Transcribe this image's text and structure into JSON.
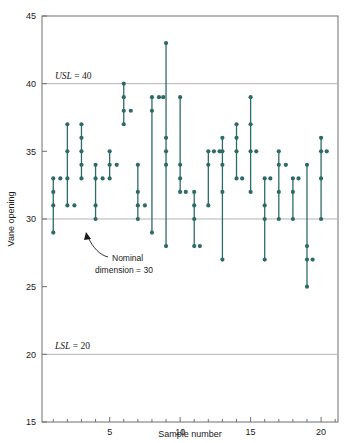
{
  "chart_data": {
    "type": "scatter",
    "title": "",
    "xlabel": "Sample number",
    "ylabel": "Vane opening",
    "xlim": [
      0.2,
      21.2
    ],
    "ylim": [
      15,
      45
    ],
    "xticks": [
      5,
      10,
      15,
      20
    ],
    "xtick_labels": [
      "5",
      "10",
      "15",
      "20"
    ],
    "xminor_step": 1,
    "yticks": [
      15,
      20,
      25,
      30,
      35,
      40,
      45
    ],
    "ytick_labels": [
      "15",
      "20",
      "25",
      "30",
      "35",
      "40",
      "45"
    ],
    "grid": false,
    "legend": "none",
    "series_color": "#2e6b66",
    "reference_lines": [
      {
        "name": "USL",
        "label": "USL = 40",
        "label_italic": "USL",
        "label_rest": " = 40",
        "value": 40,
        "color": "#b4b4b4"
      },
      {
        "name": "nominal",
        "label": "Nominal dimension = 30",
        "value": 30,
        "color": "#b4b4b4"
      },
      {
        "name": "LSL",
        "label": "LSL = 20",
        "label_italic": "LSL",
        "label_rest": " = 20",
        "value": 20,
        "color": "#b4b4b4"
      }
    ],
    "annotation": {
      "line1": "Nominal",
      "line2": "dimension = 30",
      "points_to_x": 2.6,
      "points_to_y": 30.2
    },
    "categories": [
      1,
      2,
      3,
      4,
      5,
      6,
      7,
      8,
      9,
      10,
      11,
      12,
      13,
      14,
      15,
      16,
      17,
      18,
      19,
      20
    ],
    "samples": [
      {
        "sample": 1,
        "values": [
          33,
          32,
          31,
          29
        ]
      },
      {
        "sample": 2,
        "values": [
          33,
          33,
          31
        ]
      },
      {
        "sample": 3,
        "values": [
          35,
          37,
          33,
          31
        ]
      },
      {
        "sample": 4,
        "values": [
          30,
          31,
          33,
          34
        ]
      },
      {
        "sample": 5,
        "values": [
          33,
          34,
          35,
          33
        ]
      },
      {
        "sample": 6,
        "values": [
          38,
          37,
          39,
          40
        ]
      },
      {
        "sample": 7,
        "values": [
          30,
          31,
          32,
          34
        ]
      },
      {
        "sample": 8,
        "values": [
          29,
          39,
          38,
          39
        ]
      },
      {
        "sample": 9,
        "values": [
          28,
          33,
          35,
          36
        ]
      },
      {
        "sample": 10,
        "values": [
          32,
          34,
          39,
          38
        ]
      },
      {
        "sample": 11,
        "values": [
          42,
          34,
          35,
          34
        ]
      },
      {
        "sample": 12,
        "values": [
          34,
          35,
          34,
          32
        ]
      },
      {
        "sample": 13,
        "values": [
          36,
          34,
          35,
          32
        ]
      },
      {
        "sample": 14,
        "values": [
          35,
          35,
          37,
          33
        ]
      },
      {
        "sample": 15,
        "values": [
          32,
          35,
          37,
          39
        ]
      },
      {
        "sample": 16,
        "values": [
          30,
          31,
          33,
          32
        ]
      },
      {
        "sample": 17,
        "values": [
          35,
          34,
          32,
          30
        ]
      },
      {
        "sample": 18,
        "values": [
          33,
          34,
          33,
          31
        ]
      },
      {
        "sample": 19,
        "values": [
          28,
          25,
          27,
          34
        ]
      },
      {
        "sample": 20,
        "values": [
          35,
          36,
          33,
          30
        ]
      }
    ],
    "points": [
      {
        "x": 1,
        "y": [
          29,
          31,
          32,
          33
        ]
      },
      {
        "x": 1.5,
        "y": [
          33
        ]
      },
      {
        "x": 2,
        "y": [
          31,
          33,
          35,
          37
        ]
      },
      {
        "x": 2.5,
        "y": [
          31
        ]
      },
      {
        "x": 3,
        "y": [
          33,
          34,
          35,
          36,
          37
        ]
      },
      {
        "x": 4,
        "y": [
          30,
          31,
          33,
          34
        ]
      },
      {
        "x": 4.5,
        "y": [
          33
        ]
      },
      {
        "x": 5,
        "y": [
          33,
          34,
          35
        ]
      },
      {
        "x": 5.5,
        "y": [
          34
        ]
      },
      {
        "x": 6,
        "y": [
          37,
          38,
          39,
          40
        ]
      },
      {
        "x": 6.5,
        "y": [
          38
        ]
      },
      {
        "x": 7,
        "y": [
          30,
          31,
          32,
          34
        ]
      },
      {
        "x": 7.5,
        "y": [
          31
        ]
      },
      {
        "x": 8,
        "y": [
          29,
          38,
          39
        ]
      },
      {
        "x": 8.5,
        "y": [
          39
        ]
      },
      {
        "x": 8.8,
        "y": [
          39
        ]
      },
      {
        "x": 9,
        "y": [
          28,
          34,
          35,
          36,
          43
        ]
      },
      {
        "x": 10,
        "y": [
          32,
          33,
          34,
          39
        ]
      },
      {
        "x": 10.4,
        "y": [
          32
        ]
      },
      {
        "x": 11,
        "y": [
          28,
          30,
          31,
          32
        ]
      },
      {
        "x": 11.4,
        "y": [
          28
        ]
      },
      {
        "x": 12,
        "y": [
          31,
          34,
          35
        ]
      },
      {
        "x": 12.4,
        "y": [
          35
        ]
      },
      {
        "x": 12.8,
        "y": [
          35
        ]
      },
      {
        "x": 13,
        "y": [
          27,
          32,
          34,
          35,
          36
        ]
      },
      {
        "x": 14,
        "y": [
          33,
          35,
          36,
          37
        ]
      },
      {
        "x": 14.4,
        "y": [
          33
        ]
      },
      {
        "x": 15,
        "y": [
          32,
          35,
          37,
          39
        ]
      },
      {
        "x": 15.4,
        "y": [
          35
        ]
      },
      {
        "x": 16,
        "y": [
          27,
          30,
          31,
          33
        ]
      },
      {
        "x": 16.4,
        "y": [
          33
        ]
      },
      {
        "x": 17,
        "y": [
          30,
          32,
          34,
          35
        ]
      },
      {
        "x": 17.5,
        "y": [
          34
        ]
      },
      {
        "x": 18,
        "y": [
          30,
          32,
          33
        ]
      },
      {
        "x": 18.4,
        "y": [
          33
        ]
      },
      {
        "x": 19,
        "y": [
          25,
          27,
          28,
          34
        ]
      },
      {
        "x": 19.4,
        "y": [
          27
        ]
      },
      {
        "x": 20,
        "y": [
          30,
          33,
          35,
          36
        ]
      },
      {
        "x": 20.4,
        "y": [
          35
        ]
      }
    ]
  },
  "axis": {
    "y_title": "Vane opening",
    "x_title": "Sample number"
  }
}
